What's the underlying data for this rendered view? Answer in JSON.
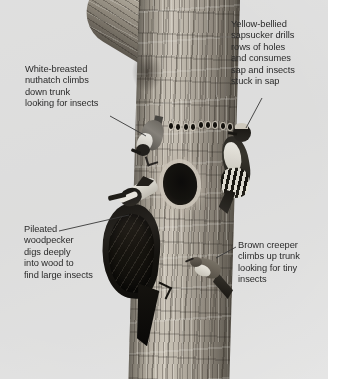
{
  "figure": {
    "kind": "annotated-photograph",
    "background_color": "#e9e9e9",
    "text_color": "#2b2b2b"
  },
  "labels": {
    "nuthatch": {
      "text": "White-breasted\nnuthatch climbs\ndown trunk\nlooking for insects",
      "species": "White-breasted nuthatch"
    },
    "sapsucker": {
      "text": "Yellow-bellied\nsapsucker drills\nrows of holes\nand consumes\nsap and insects\nstuck in sap",
      "species": "Yellow-bellied sapsucker"
    },
    "pileated": {
      "text": "Pileated\nwoodpecker\ndigs deeply\ninto wood to\nfind large insects",
      "species": "Pileated woodpecker"
    },
    "creeper": {
      "text": "Brown creeper\nclimbs up trunk\nlooking for tiny\ninsects",
      "species": "Brown creeper"
    }
  },
  "scene": {
    "trunk": {
      "name": "tree-trunk"
    },
    "branch": {
      "name": "tree-branch"
    },
    "cavity": {
      "name": "excavated-cavity"
    },
    "sap_holes": {
      "name": "sapsucker-hole-row",
      "count": 9
    },
    "birds": [
      {
        "name": "white-breasted-nuthatch",
        "posture": "head-down"
      },
      {
        "name": "yellow-bellied-sapsucker",
        "posture": "clinging"
      },
      {
        "name": "pileated-woodpecker",
        "posture": "excavating"
      },
      {
        "name": "brown-creeper",
        "posture": "climbing-up"
      }
    ]
  }
}
